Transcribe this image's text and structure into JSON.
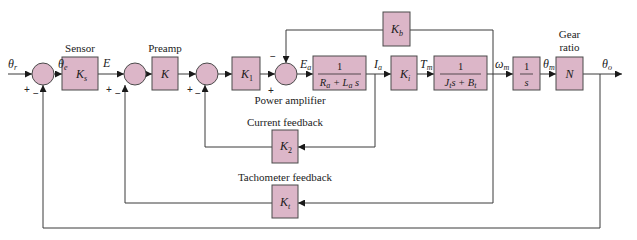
{
  "diagram": {
    "type": "control-system-block-diagram",
    "signals": {
      "theta_r": "θ",
      "theta_r_sub": "r",
      "theta_e": "θ",
      "theta_e_sub": "e",
      "E": "E",
      "E_a": "E",
      "E_a_sub": "a",
      "I_a": "I",
      "I_a_sub": "a",
      "T_m": "T",
      "T_m_sub": "m",
      "omega_m": "ω",
      "omega_m_sub": "m",
      "theta_m": "θ",
      "theta_m_sub": "m",
      "theta_o": "θ",
      "theta_o_sub": "o"
    },
    "blocks": {
      "sensor": {
        "caption": "Sensor",
        "gain": "K",
        "gain_sub": "s"
      },
      "preamp": {
        "caption": "Preamp",
        "gain": "K"
      },
      "k1": {
        "gain": "K",
        "gain_sub": "1"
      },
      "power_amplifier": {
        "caption": "Power amplifier"
      },
      "armature": {
        "numerator": "1",
        "denominator": "R",
        "den_sub1": "a",
        "den_mid": " + L",
        "den_sub2": "a",
        "den_end": " s"
      },
      "ki": {
        "gain": "K",
        "gain_sub": "i"
      },
      "mechanical": {
        "numerator": "1",
        "den_a": "J",
        "den_a_sub": "t",
        "den_b": "s + B",
        "den_b_sub": "t"
      },
      "integrator": {
        "numerator": "1",
        "denominator": "s"
      },
      "gear": {
        "caption_line1": "Gear",
        "caption_line2": "ratio",
        "gain": "N"
      },
      "kb": {
        "gain": "K",
        "gain_sub": "b"
      },
      "k2": {
        "caption": "Current feedback",
        "gain": "K",
        "gain_sub": "2"
      },
      "kt": {
        "caption": "Tachometer feedback",
        "gain": "K",
        "gain_sub": "t"
      }
    },
    "signs": {
      "plus": "+",
      "minus": "−"
    },
    "colors": {
      "block_fill": "#dcb6c8",
      "line": "#3a3a3a"
    }
  }
}
